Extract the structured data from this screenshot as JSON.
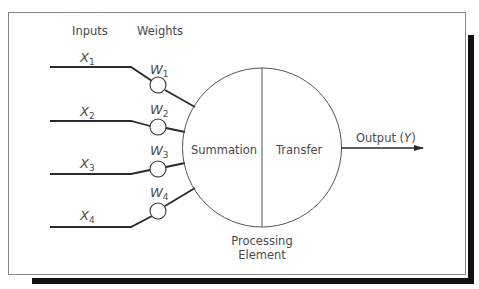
{
  "figure": {
    "headers": {
      "inputs": "Inputs",
      "weights": "Weights"
    },
    "inputs": [
      {
        "symbol": "X",
        "index": "1"
      },
      {
        "symbol": "X",
        "index": "2"
      },
      {
        "symbol": "X",
        "index": "3"
      },
      {
        "symbol": "X",
        "index": "4"
      }
    ],
    "weights": [
      {
        "symbol": "W",
        "index": "1"
      },
      {
        "symbol": "W",
        "index": "2"
      },
      {
        "symbol": "W",
        "index": "3"
      },
      {
        "symbol": "W",
        "index": "4"
      }
    ],
    "processing_element": {
      "left_label": "Summation",
      "right_label": "Transfer",
      "caption_line1": "Processing",
      "caption_line2": "Element"
    },
    "output": {
      "label": "Output (",
      "symbol": "Y",
      "close": ")"
    }
  },
  "colors": {
    "line": "#2a2a2a",
    "text": "#4a4a4a",
    "frame": "#888888",
    "shadow": "#111111",
    "background": "#ffffff"
  }
}
